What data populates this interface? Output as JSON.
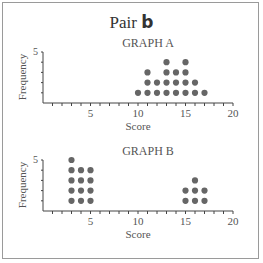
{
  "title": {
    "prefix": "Pair",
    "bold": "b"
  },
  "chart_data": [
    {
      "type": "scatter",
      "subtype": "dot-plot",
      "title": "GRAPH A",
      "xlabel": "Score",
      "ylabel": "Frequency",
      "xlim": [
        0,
        20
      ],
      "ylim": [
        0,
        5
      ],
      "x_ticks": [
        5,
        10,
        15,
        20
      ],
      "y_ticks": [
        5
      ],
      "grid": false,
      "categories": [
        10,
        11,
        12,
        13,
        14,
        15,
        16,
        17
      ],
      "values": [
        1,
        3,
        2,
        4,
        3,
        4,
        2,
        1
      ]
    },
    {
      "type": "scatter",
      "subtype": "dot-plot",
      "title": "GRAPH B",
      "xlabel": "Score",
      "ylabel": "Frequency",
      "xlim": [
        0,
        20
      ],
      "ylim": [
        0,
        5
      ],
      "x_ticks": [
        5,
        10,
        15,
        20
      ],
      "y_ticks": [
        5
      ],
      "grid": false,
      "categories": [
        3,
        4,
        5,
        15,
        16,
        17
      ],
      "values": [
        5,
        4,
        4,
        2,
        3,
        2
      ]
    }
  ],
  "colors": {
    "dot": "#666666",
    "axis": "#444444",
    "border": "#9a9a9a"
  }
}
